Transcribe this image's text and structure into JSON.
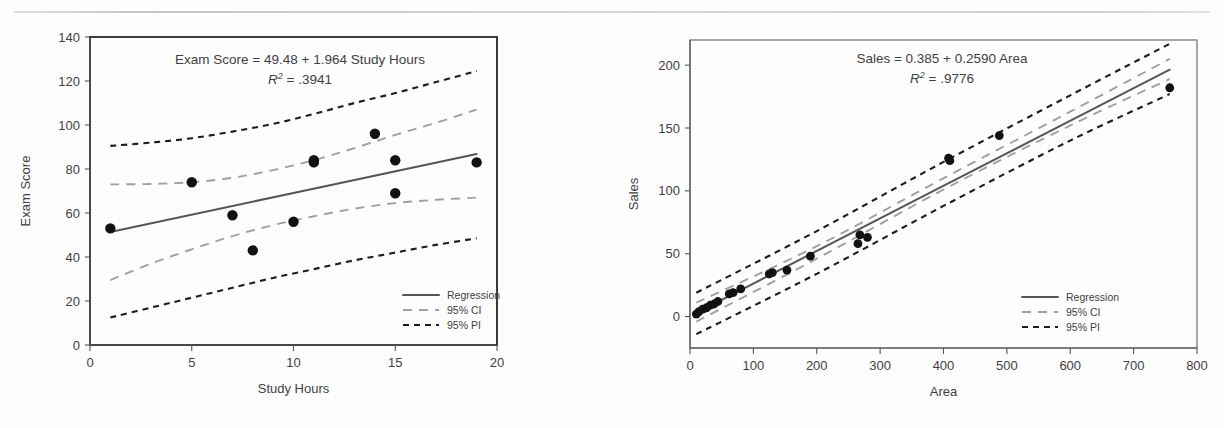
{
  "page": {
    "background_color": "#fdfdfd",
    "top_rule_color": "#c6c6c6"
  },
  "colors": {
    "regression": "#555555",
    "ci": "#a0a0a0",
    "pi": "#1d1d1d",
    "point": "#121212",
    "axis": "#555555",
    "text": "#3f3f3f"
  },
  "legend_common": {
    "items": [
      {
        "label": "Regression",
        "style": "solid",
        "color": "#555555"
      },
      {
        "label": "95% CI",
        "style": "long-dash",
        "color": "#a0a0a0"
      },
      {
        "label": "95% PI",
        "style": "short-dash",
        "color": "#1d1d1d"
      }
    ]
  },
  "charts": [
    {
      "id": "exam-score-vs-study-hours",
      "chart_data": {
        "type": "scatter",
        "title": "Exam Score = 49.48 + 1.964 Study Hours",
        "subtitle_r2_label": "R",
        "subtitle_r2_exp": "2",
        "subtitle_r2_value": "= .3941",
        "r2": 0.3941,
        "intercept": 49.48,
        "slope": 1.964,
        "xlabel": "Study Hours",
        "ylabel": "Exam Score",
        "xlim": [
          0,
          20
        ],
        "ylim": [
          0,
          140
        ],
        "xticks": [
          0,
          5,
          10,
          15,
          20
        ],
        "yticks": [
          0,
          20,
          40,
          60,
          80,
          100,
          120,
          140
        ],
        "grid": false,
        "legend_position": "bottom-right",
        "points": [
          {
            "x": 1,
            "y": 53
          },
          {
            "x": 5,
            "y": 74
          },
          {
            "x": 7,
            "y": 59
          },
          {
            "x": 8,
            "y": 43
          },
          {
            "x": 10,
            "y": 56
          },
          {
            "x": 11,
            "y": 84
          },
          {
            "x": 11,
            "y": 83
          },
          {
            "x": 14,
            "y": 96
          },
          {
            "x": 15,
            "y": 84
          },
          {
            "x": 15,
            "y": 69
          },
          {
            "x": 19,
            "y": 83
          }
        ],
        "series": [
          {
            "name": "Regression",
            "style": "solid",
            "x": [
              1,
              19
            ],
            "values": [
              51.4,
              86.8
            ]
          },
          {
            "name": "95% CI upper",
            "style": "long-dash",
            "x": [
              1,
              3,
              5,
              7,
              9,
              11,
              13,
              15,
              17,
              19
            ],
            "values": [
              73,
              73.2,
              74,
              76,
              79.5,
              84,
              89.5,
              95.5,
              101,
              107
            ]
          },
          {
            "name": "95% CI lower",
            "style": "long-dash",
            "x": [
              1,
              3,
              5,
              7,
              9,
              11,
              13,
              15,
              17,
              19
            ],
            "values": [
              29.5,
              37,
              43.5,
              49.5,
              54.5,
              58.5,
              62,
              64.5,
              66,
              67
            ]
          },
          {
            "name": "95% PI upper",
            "style": "short-dash",
            "x": [
              1,
              3,
              5,
              7,
              9,
              11,
              13,
              15,
              17,
              19
            ],
            "values": [
              90.5,
              92,
              94,
              97,
              100.5,
              105,
              110,
              114.5,
              119.5,
              124.5
            ]
          },
          {
            "name": "95% PI lower",
            "style": "short-dash",
            "x": [
              1,
              3,
              5,
              7,
              9,
              11,
              13,
              15,
              17,
              19
            ],
            "values": [
              12.5,
              17,
              21.5,
              26,
              30.5,
              34.5,
              38.5,
              42,
              45.5,
              48.5
            ]
          }
        ]
      }
    },
    {
      "id": "sales-vs-area",
      "chart_data": {
        "type": "scatter",
        "title": "Sales = 0.385 + 0.2590 Area",
        "subtitle_r2_label": "R",
        "subtitle_r2_exp": "2",
        "subtitle_r2_value": "= .9776",
        "r2": 0.9776,
        "intercept": 0.385,
        "slope": 0.259,
        "xlabel": "Area",
        "ylabel": "Sales",
        "xlim": [
          0,
          800
        ],
        "ylim": [
          -25,
          220
        ],
        "xticks": [
          0,
          100,
          200,
          300,
          400,
          500,
          600,
          700,
          800
        ],
        "yticks": [
          0,
          50,
          100,
          150,
          200
        ],
        "grid": false,
        "legend_position": "bottom-right",
        "points": [
          {
            "x": 10,
            "y": 2
          },
          {
            "x": 14,
            "y": 4
          },
          {
            "x": 20,
            "y": 6
          },
          {
            "x": 26,
            "y": 7
          },
          {
            "x": 32,
            "y": 9
          },
          {
            "x": 38,
            "y": 10
          },
          {
            "x": 44,
            "y": 12
          },
          {
            "x": 62,
            "y": 18
          },
          {
            "x": 68,
            "y": 19
          },
          {
            "x": 80,
            "y": 22
          },
          {
            "x": 125,
            "y": 34
          },
          {
            "x": 130,
            "y": 35
          },
          {
            "x": 153,
            "y": 37
          },
          {
            "x": 190,
            "y": 48
          },
          {
            "x": 265,
            "y": 58
          },
          {
            "x": 268,
            "y": 65
          },
          {
            "x": 280,
            "y": 63
          },
          {
            "x": 408,
            "y": 126
          },
          {
            "x": 410,
            "y": 124
          },
          {
            "x": 488,
            "y": 144
          },
          {
            "x": 757,
            "y": 182
          }
        ],
        "series": [
          {
            "name": "Regression",
            "style": "solid",
            "x": [
              10,
              757
            ],
            "values": [
              3.0,
              196.4
            ]
          },
          {
            "name": "95% CI upper",
            "style": "long-dash",
            "x": [
              10,
              200,
              400,
              600,
              757
            ],
            "values": [
              11,
              56,
              110,
              163,
              205
            ]
          },
          {
            "name": "95% CI lower",
            "style": "long-dash",
            "x": [
              10,
              200,
              400,
              600,
              757
            ],
            "values": [
              -4,
              46,
              101,
              152,
              189
            ]
          },
          {
            "name": "95% PI upper",
            "style": "short-dash",
            "x": [
              10,
              200,
              400,
              600,
              757
            ],
            "values": [
              19,
              68,
              123,
              176,
              217
            ]
          },
          {
            "name": "95% PI lower",
            "style": "short-dash",
            "x": [
              10,
              200,
              400,
              600,
              757
            ],
            "values": [
              -14,
              34,
              88,
              140,
              177
            ]
          }
        ]
      }
    }
  ]
}
